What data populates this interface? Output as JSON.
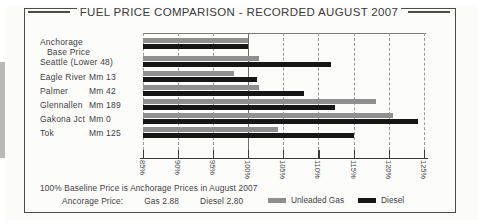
{
  "chart_title": "FUEL PRICE COMPARISON - RECORDED AUGUST 2007",
  "footnotes": {
    "baseline": "100% Baseline Price is Anchorage Prices in August 2007",
    "prices_prefix": "Ancorage Price:",
    "gas_price": "Gas 2.88",
    "diesel_price": "Diesel 2.80"
  },
  "legend": {
    "items": [
      {
        "label": "Unleaded Gas",
        "color": "#8f8f8f",
        "key": "gas"
      },
      {
        "label": "Diesel",
        "color": "#161616",
        "key": "diesel"
      }
    ]
  },
  "chart_data": {
    "type": "bar",
    "orientation": "horizontal",
    "title": "FUEL PRICE COMPARISON - RECORDED AUGUST 2007",
    "xlabel": "",
    "ylabel": "",
    "xlim": [
      85,
      125
    ],
    "xticks": [
      85,
      90,
      95,
      100,
      105,
      110,
      115,
      120,
      125
    ],
    "xtick_labels": [
      "85%",
      "90%",
      "95%",
      "100%",
      "105%",
      "110%",
      "115%",
      "120%",
      "125%"
    ],
    "grid": true,
    "baseline": 100,
    "legend_position": "bottom-right",
    "categories": [
      "Anchorage Base Price",
      "Seattle (Lower 48)",
      "Eagle River",
      "Palmer",
      "Glennallen",
      "Gakona Jct",
      "Tok"
    ],
    "category_labels": [
      {
        "name": "Anchorage",
        "sub": "Base Price",
        "mm": ""
      },
      {
        "name": "Seattle (Lower 48)",
        "sub": "",
        "mm": ""
      },
      {
        "name": "Eagle River",
        "sub": "",
        "mm": "Mm 13"
      },
      {
        "name": "Palmer",
        "sub": "",
        "mm": "Mm 42"
      },
      {
        "name": "Glennallen",
        "sub": "",
        "mm": "Mm 189"
      },
      {
        "name": "Gakona Jct",
        "sub": "",
        "mm": "Mm 0"
      },
      {
        "name": "Tok",
        "sub": "",
        "mm": "Mm 125"
      }
    ],
    "series": [
      {
        "name": "Unleaded Gas",
        "color": "#8f8f8f",
        "values": [
          100.0,
          101.5,
          98.0,
          101.6,
          118.2,
          120.6,
          104.3
        ]
      },
      {
        "name": "Diesel",
        "color": "#161616",
        "values": [
          100.0,
          111.8,
          101.3,
          108.0,
          112.3,
          124.2,
          115.0
        ]
      }
    ]
  }
}
